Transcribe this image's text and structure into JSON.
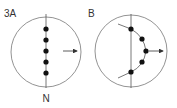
{
  "figure": {
    "panelA": {
      "label": "3A",
      "bottom_label": "N",
      "circle": {
        "cx": 46,
        "cy": 52,
        "r": 35
      },
      "axis": {
        "x": 46,
        "y1": 14,
        "y2": 88
      },
      "dots": [
        [
          46,
          29
        ],
        [
          46,
          40
        ],
        [
          46,
          51
        ],
        [
          46,
          62
        ],
        [
          46,
          73
        ]
      ],
      "arrow": {
        "x1": 63,
        "y1": 51,
        "x2": 77,
        "y2": 51
      }
    },
    "panelB": {
      "label": "B",
      "circle": {
        "cx": 131,
        "cy": 51,
        "r": 36
      },
      "axis": {
        "x": 131,
        "y1": 14,
        "y2": 88
      },
      "dots": [
        [
          131,
          29
        ],
        [
          142,
          39
        ],
        [
          146,
          51
        ],
        [
          142,
          62
        ],
        [
          131,
          72
        ]
      ],
      "curve_path": "M118 24 L131 29 Q144 36 146 51 Q144 66 131 72 L118 78",
      "arrow": {
        "x1": 149,
        "y1": 51,
        "x2": 163,
        "y2": 51
      }
    },
    "colors": {
      "line": "#555555",
      "dot": "#111111",
      "circle": "#777777"
    }
  }
}
